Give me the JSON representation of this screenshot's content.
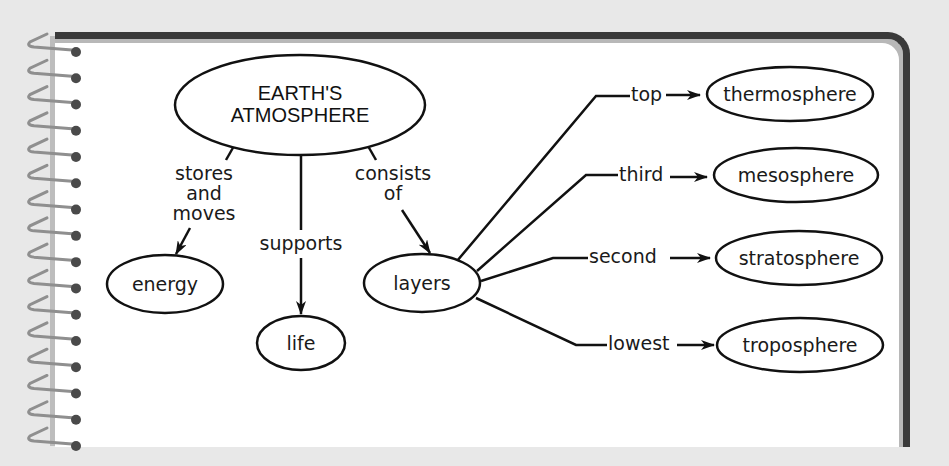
{
  "diagram": {
    "root": {
      "id": "earths-atmosphere",
      "line1": "EARTH'S",
      "line2": "ATMOSPHERE",
      "cx": 300,
      "cy": 105,
      "rx": 125,
      "ry": 50
    },
    "nodes": [
      {
        "id": "energy",
        "label": "energy",
        "cx": 165,
        "cy": 284,
        "rx": 58,
        "ry": 29
      },
      {
        "id": "life",
        "label": "life",
        "cx": 301,
        "cy": 343,
        "rx": 44,
        "ry": 27
      },
      {
        "id": "layers",
        "label": "layers",
        "cx": 422,
        "cy": 283,
        "rx": 58,
        "ry": 29
      },
      {
        "id": "thermosphere",
        "label": "thermosphere",
        "cx": 790,
        "cy": 93,
        "rx": 83,
        "ry": 27
      },
      {
        "id": "mesosphere",
        "label": "mesosphere",
        "cx": 796,
        "cy": 174,
        "rx": 82,
        "ry": 27
      },
      {
        "id": "stratosphere",
        "label": "stratosphere",
        "cx": 799,
        "cy": 258,
        "rx": 83,
        "ry": 27
      },
      {
        "id": "troposphere",
        "label": "troposphere",
        "cx": 800,
        "cy": 345,
        "rx": 83,
        "ry": 27
      }
    ],
    "edges": [
      {
        "from": "earths-atmosphere",
        "to": "energy",
        "label_lines": [
          "stores",
          "and",
          "moves"
        ]
      },
      {
        "from": "earths-atmosphere",
        "to": "life",
        "label_lines": [
          "supports"
        ]
      },
      {
        "from": "earths-atmosphere",
        "to": "layers",
        "label_lines": [
          "consists",
          "of"
        ]
      },
      {
        "from": "layers",
        "to": "thermosphere",
        "label": "top"
      },
      {
        "from": "layers",
        "to": "mesosphere",
        "label": "third"
      },
      {
        "from": "layers",
        "to": "stratosphere",
        "label": "second"
      },
      {
        "from": "layers",
        "to": "troposphere",
        "label": "lowest"
      }
    ],
    "labels": {
      "stores": "stores",
      "and": "and",
      "moves": "moves",
      "supports": "supports",
      "consists": "consists",
      "of": "of",
      "top": "top",
      "third": "third",
      "second": "second",
      "lowest": "lowest"
    }
  },
  "notebook": {
    "spiral_ring_count": 16
  },
  "colors": {
    "background": "#e8e8e8",
    "page": "#ffffff",
    "page_border": "#3a3a3a",
    "ink": "#111111",
    "spiral": "#8f8f8f"
  }
}
